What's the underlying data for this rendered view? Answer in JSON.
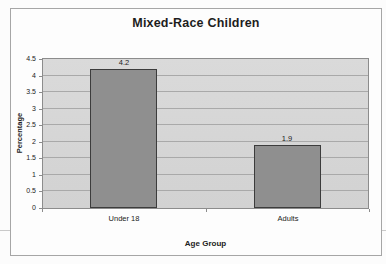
{
  "chart_data": {
    "type": "bar",
    "title": "Mixed-Race Children",
    "xlabel": "Age Group",
    "ylabel": "Percentage",
    "categories": [
      "Under 18",
      "Adults"
    ],
    "values": [
      4.2,
      1.9
    ],
    "value_labels": [
      "4.2",
      "1.9"
    ],
    "ylim": [
      0,
      4.5
    ],
    "ytick_step": 0.5,
    "ytick_labels": [
      "0",
      "0.5",
      "1",
      "1.5",
      "2",
      "2.5",
      "3",
      "3.5",
      "4",
      "4.5"
    ],
    "grid": true,
    "legend": false,
    "colors": {
      "bar_fill": "#8f8f8f",
      "bar_border": "#3c3c3c",
      "plot_bg_top": "#dadada",
      "plot_bg_bottom": "#d2d2d2",
      "gridline": "#a9a9a9",
      "plot_border": "#8c8c8c",
      "frame_border": "#a6a6a6",
      "text": "#1d1d1d"
    }
  }
}
